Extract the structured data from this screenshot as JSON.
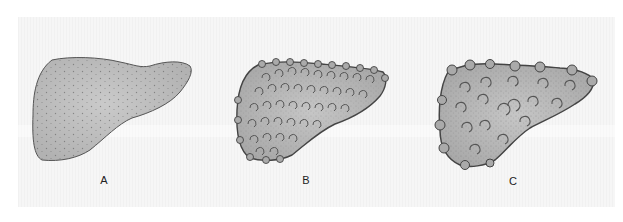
{
  "figure": {
    "panels": [
      {
        "id": "A",
        "label": "A",
        "depiction": "normal liver, smooth stippled surface"
      },
      {
        "id": "B",
        "label": "B",
        "depiction": "liver with small uniform nodules (micronodular)"
      },
      {
        "id": "C",
        "label": "C",
        "depiction": "liver with irregular larger nodules (macronodular)"
      }
    ],
    "colors": {
      "background": "#ffffff",
      "panel": "#f3f3f3",
      "organ_fill": "#b9b9b9",
      "organ_center": "#c8c8c8",
      "outline": "#4a4a4a",
      "label": "#222222"
    }
  }
}
